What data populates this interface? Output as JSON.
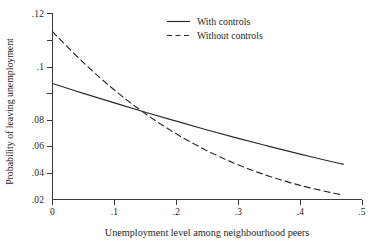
{
  "chart_data": {
    "type": "line",
    "title": "",
    "xlabel": "Unemployment level among neighbourhood peers",
    "ylabel": "Probability of leaving unemployment",
    "xlim": [
      0,
      0.5
    ],
    "ylim": [
      0.02,
      0.12
    ],
    "grid": false,
    "legend_position": "top-center",
    "xticks": [
      "0",
      ".1",
      ".2",
      ".3",
      ".4",
      ".5"
    ],
    "xtick_values": [
      0,
      0.1,
      0.2,
      0.3,
      0.4,
      0.5
    ],
    "yticks": [
      ".02",
      ".04",
      ".06",
      ".08",
      ".1",
      ".12"
    ],
    "ytick_values": [
      0.02,
      0.04,
      0.06,
      0.08,
      0.1,
      0.12
    ],
    "series": [
      {
        "name": "With controls",
        "style": "solid",
        "color": "#2b2b2b",
        "x": [
          0,
          0.05,
          0.1,
          0.15,
          0.2,
          0.25,
          0.3,
          0.35,
          0.4,
          0.45,
          0.47
        ],
        "values": [
          0.0822,
          0.0769,
          0.0718,
          0.0668,
          0.062,
          0.0573,
          0.0528,
          0.0485,
          0.0443,
          0.0404,
          0.0389
        ]
      },
      {
        "name": "Without controls",
        "style": "dashed",
        "color": "#2b2b2b",
        "x": [
          0,
          0.05,
          0.1,
          0.15,
          0.2,
          0.25,
          0.3,
          0.35,
          0.4,
          0.45,
          0.47
        ],
        "values": [
          0.11,
          0.0934,
          0.0787,
          0.066,
          0.0552,
          0.0461,
          0.0386,
          0.0325,
          0.0276,
          0.0237,
          0.0224
        ]
      }
    ],
    "annotations": {
      "crossing_point": {
        "x": 0.165,
        "y": 0.0605
      }
    }
  },
  "legend": {
    "entries": [
      {
        "label": "With controls",
        "style": "solid"
      },
      {
        "label": "Without controls",
        "style": "dashed"
      }
    ]
  }
}
